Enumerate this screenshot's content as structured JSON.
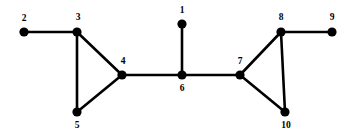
{
  "figure": {
    "background_color": "#ffffff",
    "node_color": "#000000",
    "edge_color": "#000000",
    "label_color": "#000000",
    "width": 354,
    "height": 139
  },
  "chart_data": {
    "type": "diagram",
    "title": "",
    "subtitle": "",
    "xlabel": "",
    "ylabel": "",
    "grid": false,
    "legend": null,
    "node_radius": 4.6,
    "edge_width": 2.6,
    "nodes": [
      {
        "id": "1",
        "label": "1",
        "x": 182,
        "y": 24,
        "label_x": 182,
        "label_y": 11,
        "label_pos": "above"
      },
      {
        "id": "2",
        "label": "2",
        "x": 24,
        "y": 32,
        "label_x": 24,
        "label_y": 19,
        "label_pos": "above"
      },
      {
        "id": "3",
        "label": "3",
        "x": 77,
        "y": 32,
        "label_x": 78,
        "label_y": 18,
        "label_pos": "above"
      },
      {
        "id": "4",
        "label": "4",
        "x": 122,
        "y": 75,
        "label_x": 123,
        "label_y": 62,
        "label_pos": "above"
      },
      {
        "id": "5",
        "label": "5",
        "x": 77,
        "y": 112,
        "label_x": 77,
        "label_y": 126,
        "label_pos": "below"
      },
      {
        "id": "6",
        "label": "6",
        "x": 182,
        "y": 75,
        "label_x": 182,
        "label_y": 89,
        "label_pos": "below"
      },
      {
        "id": "7",
        "label": "7",
        "x": 240,
        "y": 75,
        "label_x": 240,
        "label_y": 62,
        "label_pos": "above"
      },
      {
        "id": "8",
        "label": "8",
        "x": 281,
        "y": 32,
        "label_x": 281,
        "label_y": 18,
        "label_pos": "above"
      },
      {
        "id": "9",
        "label": "9",
        "x": 332,
        "y": 32,
        "label_x": 332,
        "label_y": 18,
        "label_pos": "above"
      },
      {
        "id": "10",
        "label": "10",
        "x": 285,
        "y": 112,
        "label_x": 286,
        "label_y": 126,
        "label_pos": "below"
      }
    ],
    "edges": [
      {
        "source": "2",
        "target": "3"
      },
      {
        "source": "3",
        "target": "4"
      },
      {
        "source": "3",
        "target": "5"
      },
      {
        "source": "4",
        "target": "5"
      },
      {
        "source": "4",
        "target": "6"
      },
      {
        "source": "1",
        "target": "6"
      },
      {
        "source": "6",
        "target": "7"
      },
      {
        "source": "7",
        "target": "8"
      },
      {
        "source": "7",
        "target": "10"
      },
      {
        "source": "8",
        "target": "10"
      },
      {
        "source": "8",
        "target": "9"
      }
    ],
    "node_count": 10,
    "edge_count": 11
  }
}
